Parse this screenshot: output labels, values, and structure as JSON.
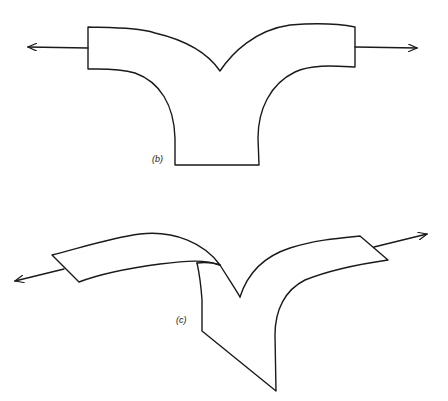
{
  "figures": [
    {
      "id": "b",
      "label": "(b)",
      "description": "Y-shaped junction with two horizontal arms pulled outward by arrows"
    },
    {
      "id": "c",
      "label": "(c)",
      "description": "Twisted Y-shaped junction with arms pulled outward by arrows in perspective"
    }
  ],
  "colors": {
    "stroke": "#1a1a1a",
    "background": "#ffffff"
  }
}
